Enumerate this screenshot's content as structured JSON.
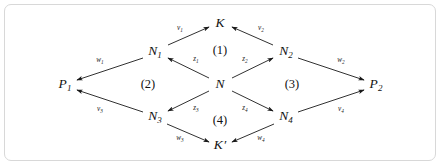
{
  "figure": {
    "frame": {
      "border_color": "#d8d8d8",
      "background_color": "#ffffff"
    },
    "ink_color": "#1a1a1a"
  },
  "nodes": [
    {
      "id": "K",
      "base": "K",
      "sub": "",
      "prime": "",
      "x": 220,
      "y": 23
    },
    {
      "id": "N1",
      "base": "N",
      "sub": "1",
      "prime": "",
      "x": 155,
      "y": 52
    },
    {
      "id": "N2",
      "base": "N",
      "sub": "2",
      "prime": "",
      "x": 286,
      "y": 52
    },
    {
      "id": "P1",
      "base": "P",
      "sub": "1",
      "prime": "",
      "x": 65,
      "y": 85
    },
    {
      "id": "N",
      "base": "N",
      "sub": "",
      "prime": "",
      "x": 220,
      "y": 84
    },
    {
      "id": "P2",
      "base": "P",
      "sub": "2",
      "prime": "",
      "x": 376,
      "y": 85
    },
    {
      "id": "N3",
      "base": "N",
      "sub": "3",
      "prime": "",
      "x": 155,
      "y": 117
    },
    {
      "id": "N4",
      "base": "N",
      "sub": "4",
      "prime": "",
      "x": 286,
      "y": 117
    },
    {
      "id": "Kp",
      "base": "K",
      "sub": "",
      "prime": "′",
      "x": 220,
      "y": 145
    }
  ],
  "edges": [
    {
      "id": "v1",
      "base": "v",
      "sub": "1",
      "from": "N1",
      "to": "K",
      "x1": 168,
      "y1": 45,
      "x2": 209,
      "y2": 27,
      "lx": 180,
      "ly": 29
    },
    {
      "id": "v2",
      "base": "v",
      "sub": "2",
      "from": "N2",
      "to": "K",
      "x1": 273,
      "y1": 45,
      "x2": 232,
      "y2": 27,
      "lx": 261,
      "ly": 29
    },
    {
      "id": "w1",
      "base": "w",
      "sub": "1",
      "from": "N1",
      "to": "P1",
      "x1": 143,
      "y1": 58,
      "x2": 77,
      "y2": 80,
      "lx": 100,
      "ly": 61
    },
    {
      "id": "w2",
      "base": "w",
      "sub": "2",
      "from": "N2",
      "to": "P2",
      "x1": 298,
      "y1": 58,
      "x2": 364,
      "y2": 80,
      "lx": 341,
      "ly": 61
    },
    {
      "id": "v3",
      "base": "v",
      "sub": "3",
      "from": "N3",
      "to": "P1",
      "x1": 143,
      "y1": 112,
      "x2": 77,
      "y2": 90,
      "lx": 100,
      "ly": 110
    },
    {
      "id": "v4",
      "base": "v",
      "sub": "4",
      "from": "N4",
      "to": "P2",
      "x1": 298,
      "y1": 112,
      "x2": 364,
      "y2": 90,
      "lx": 341,
      "ly": 110
    },
    {
      "id": "z1",
      "base": "z",
      "sub": "1",
      "from": "N",
      "to": "N1",
      "x1": 209,
      "y1": 78,
      "x2": 168,
      "y2": 58,
      "lx": 196,
      "ly": 60
    },
    {
      "id": "z2",
      "base": "z",
      "sub": "2",
      "from": "N",
      "to": "N2",
      "x1": 232,
      "y1": 78,
      "x2": 273,
      "y2": 58,
      "lx": 245,
      "ly": 60
    },
    {
      "id": "z3",
      "base": "z",
      "sub": "3",
      "from": "N",
      "to": "N3",
      "x1": 209,
      "y1": 91,
      "x2": 168,
      "y2": 111,
      "lx": 196,
      "ly": 109
    },
    {
      "id": "z4",
      "base": "z",
      "sub": "4",
      "from": "N",
      "to": "N4",
      "x1": 232,
      "y1": 91,
      "x2": 273,
      "y2": 111,
      "lx": 245,
      "ly": 109
    },
    {
      "id": "w3",
      "base": "w",
      "sub": "3",
      "from": "N3",
      "to": "Kp",
      "x1": 167,
      "y1": 124,
      "x2": 209,
      "y2": 142,
      "lx": 180,
      "ly": 139
    },
    {
      "id": "w4",
      "base": "w",
      "sub": "4",
      "from": "N4",
      "to": "Kp",
      "x1": 274,
      "y1": 124,
      "x2": 232,
      "y2": 142,
      "lx": 261,
      "ly": 139
    }
  ],
  "regions": [
    {
      "id": "r1",
      "label": "(1)",
      "x": 220,
      "y": 50
    },
    {
      "id": "r2",
      "label": "(2)",
      "x": 148,
      "y": 84
    },
    {
      "id": "r3",
      "label": "(3)",
      "x": 292,
      "y": 84
    },
    {
      "id": "r4",
      "label": "(4)",
      "x": 220,
      "y": 120
    }
  ]
}
